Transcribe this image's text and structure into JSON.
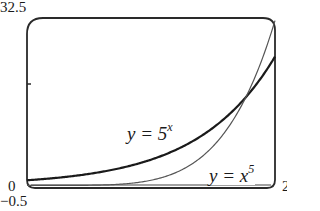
{
  "chart_data": {
    "type": "line",
    "title": "",
    "xlabel": "",
    "ylabel": "",
    "xlim": [
      0,
      2
    ],
    "ylim": [
      -0.5,
      32.5
    ],
    "tick_labels": {
      "y_top": "32.5",
      "y_bottom": "-0.5",
      "x_left": "0",
      "x_right": "2"
    },
    "yticks": [
      20
    ],
    "grid": false,
    "legend": "inline labels",
    "series": [
      {
        "name": "y = 5^x",
        "label_base": "y = 5",
        "label_sup": "x",
        "stroke": "#1a1a1a",
        "weight": "heavy",
        "x": [
          0,
          0.25,
          0.5,
          0.75,
          1.0,
          1.25,
          1.5,
          1.75,
          2.0
        ],
        "values": [
          1,
          1.5,
          2.24,
          3.34,
          5,
          7.48,
          11.18,
          16.72,
          25
        ]
      },
      {
        "name": "y = x^5",
        "label_base": "y = x",
        "label_sup": "5",
        "stroke": "#555555",
        "weight": "light",
        "x": [
          0,
          0.25,
          0.5,
          0.75,
          1.0,
          1.25,
          1.5,
          1.75,
          2.0
        ],
        "values": [
          0,
          0.001,
          0.031,
          0.237,
          1,
          3.05,
          7.59,
          16.41,
          32
        ]
      }
    ],
    "annotations": [
      {
        "text": "y = 5^x",
        "near_x": 1.05,
        "near_y": 8.5
      },
      {
        "text": "y = x^5",
        "near_x": 1.72,
        "near_y": 2.5
      }
    ],
    "intersection": {
      "x": 1.765,
      "y": 17.28
    }
  }
}
